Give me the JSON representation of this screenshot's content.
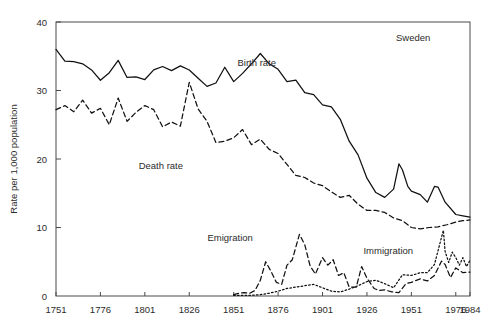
{
  "figure": {
    "region_label": "Sweden",
    "background": "#ffffff",
    "ink_color": "#111111"
  },
  "chart_data": {
    "type": "line",
    "title": "",
    "subtitle": "",
    "xlabel": "",
    "ylabel": "Rate per 1,000 population",
    "xlim": [
      1751,
      1984
    ],
    "ylim": [
      0,
      40
    ],
    "grid": false,
    "legend_position": "inline-annotations",
    "annotations": [
      {
        "text": "Sweden",
        "x": 1952,
        "y": 37.2
      },
      {
        "text": "Birth rate",
        "x": 1864,
        "y": 33.6
      },
      {
        "text": "Death rate",
        "x": 1810,
        "y": 18.6
      },
      {
        "text": "Emigration",
        "x": 1849,
        "y": 8.1
      },
      {
        "text": "Immigration",
        "x": 1938,
        "y": 6.2
      }
    ],
    "xticks": [
      1751,
      1776,
      1801,
      1826,
      1851,
      1876,
      1901,
      1926,
      1951,
      1976,
      1984
    ],
    "xticklabels": [
      "1751",
      "1776",
      "1801",
      "1826",
      "1851",
      "1876",
      "1901",
      "1926",
      "1951",
      "1976",
      "1984"
    ],
    "yticks": [
      0,
      10,
      20,
      30,
      40
    ],
    "yticklabels": [
      "0",
      "10",
      "20",
      "30",
      "40"
    ],
    "series": [
      {
        "name": "Birth rate",
        "style": "solid",
        "x": [
          1751,
          1756,
          1761,
          1766,
          1771,
          1776,
          1781,
          1786,
          1791,
          1796,
          1801,
          1806,
          1811,
          1816,
          1821,
          1826,
          1831,
          1836,
          1841,
          1846,
          1851,
          1856,
          1861,
          1866,
          1871,
          1876,
          1881,
          1886,
          1891,
          1896,
          1901,
          1906,
          1911,
          1916,
          1921,
          1926,
          1931,
          1936,
          1941,
          1944,
          1946,
          1949,
          1951,
          1956,
          1960,
          1964,
          1966,
          1970,
          1976,
          1980,
          1984
        ],
        "values": [
          36.0,
          34.3,
          34.2,
          33.9,
          33.0,
          31.5,
          32.6,
          34.4,
          31.9,
          32.0,
          31.6,
          33.0,
          33.5,
          32.9,
          33.6,
          33.0,
          31.8,
          30.6,
          31.1,
          33.4,
          31.3,
          32.5,
          33.9,
          35.4,
          33.9,
          33.1,
          31.3,
          31.5,
          29.7,
          29.4,
          27.9,
          27.6,
          25.8,
          22.6,
          20.6,
          17.2,
          15.1,
          14.4,
          15.6,
          19.3,
          18.4,
          16.0,
          15.3,
          14.8,
          13.7,
          16.0,
          15.9,
          13.7,
          11.9,
          11.7,
          11.5
        ]
      },
      {
        "name": "Death rate",
        "style": "dashed",
        "x": [
          1751,
          1756,
          1761,
          1766,
          1771,
          1776,
          1781,
          1786,
          1791,
          1796,
          1801,
          1806,
          1811,
          1816,
          1821,
          1826,
          1831,
          1836,
          1841,
          1846,
          1851,
          1856,
          1861,
          1866,
          1871,
          1876,
          1881,
          1886,
          1891,
          1896,
          1901,
          1906,
          1911,
          1916,
          1921,
          1926,
          1931,
          1936,
          1941,
          1946,
          1951,
          1956,
          1961,
          1966,
          1971,
          1976,
          1980,
          1984
        ],
        "values": [
          27.2,
          27.8,
          26.9,
          28.6,
          26.7,
          27.4,
          25.0,
          28.9,
          25.5,
          26.8,
          27.8,
          27.2,
          24.7,
          25.4,
          24.8,
          31.2,
          27.3,
          25.5,
          22.4,
          22.6,
          23.1,
          24.3,
          22.1,
          22.9,
          21.4,
          20.8,
          19.2,
          17.6,
          17.3,
          16.5,
          16.1,
          15.2,
          14.4,
          14.7,
          13.4,
          12.5,
          12.5,
          12.2,
          11.4,
          11.0,
          10.0,
          9.8,
          10.0,
          10.1,
          10.4,
          10.8,
          11.0,
          11.1
        ]
      },
      {
        "name": "Emigration",
        "style": "dashed",
        "x": [
          1851,
          1854,
          1857,
          1860,
          1863,
          1866,
          1869,
          1872,
          1875,
          1878,
          1881,
          1884,
          1888,
          1891,
          1894,
          1897,
          1901,
          1904,
          1907,
          1910,
          1913,
          1916,
          1920,
          1923,
          1926,
          1930,
          1933,
          1936,
          1940,
          1944,
          1948,
          1951,
          1956,
          1960,
          1964,
          1968,
          1970,
          1973,
          1976,
          1980,
          1984
        ],
        "values": [
          0.2,
          0.4,
          0.5,
          0.4,
          0.8,
          2.3,
          5.0,
          3.6,
          2.0,
          1.7,
          4.5,
          5.3,
          9.0,
          7.5,
          4.4,
          3.2,
          5.6,
          4.5,
          5.3,
          3.0,
          3.4,
          1.3,
          1.3,
          4.3,
          2.6,
          1.1,
          0.8,
          0.9,
          0.6,
          0.5,
          1.8,
          2.0,
          2.5,
          2.2,
          3.0,
          5.1,
          4.6,
          2.7,
          4.1,
          3.4,
          3.5
        ]
      },
      {
        "name": "Immigration",
        "style": "dotted",
        "x": [
          1851,
          1856,
          1861,
          1866,
          1871,
          1876,
          1881,
          1886,
          1891,
          1896,
          1901,
          1906,
          1911,
          1916,
          1921,
          1926,
          1931,
          1936,
          1941,
          1946,
          1951,
          1956,
          1960,
          1964,
          1966,
          1969,
          1970,
          1972,
          1974,
          1976,
          1978,
          1980,
          1982,
          1984
        ],
        "values": [
          0.1,
          0.1,
          0.1,
          0.2,
          0.4,
          0.7,
          1.1,
          1.3,
          1.5,
          1.7,
          1.2,
          0.7,
          0.6,
          1.0,
          1.5,
          2.1,
          2.3,
          1.8,
          1.2,
          3.1,
          3.0,
          3.4,
          3.4,
          4.6,
          6.6,
          9.6,
          6.5,
          4.9,
          6.4,
          5.6,
          4.5,
          5.6,
          4.3,
          5.2
        ]
      }
    ]
  }
}
